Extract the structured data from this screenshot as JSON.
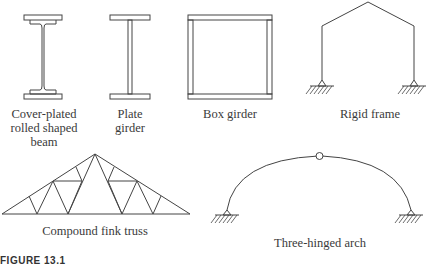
{
  "figure": {
    "caption_partial": "FIGURE 13.1",
    "items": [
      {
        "id": "cover-plated-beam",
        "label_lines": [
          "Cover-plated",
          "rolled shaped",
          "beam"
        ]
      },
      {
        "id": "plate-girder",
        "label_lines": [
          "Plate",
          "girder"
        ]
      },
      {
        "id": "box-girder",
        "label_lines": [
          "Box girder"
        ]
      },
      {
        "id": "rigid-frame",
        "label_lines": [
          "Rigid frame"
        ]
      },
      {
        "id": "compound-fink-truss",
        "label_lines": [
          "Compound fink truss"
        ]
      },
      {
        "id": "three-hinged-arch",
        "label_lines": [
          "Three-hinged arch"
        ]
      }
    ]
  },
  "colors": {
    "line": "#444444",
    "background": "#ffffff"
  }
}
